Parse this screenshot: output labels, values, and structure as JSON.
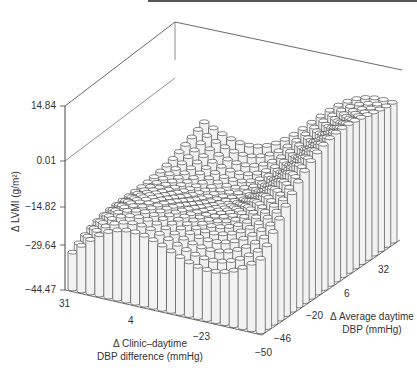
{
  "chart_data": {
    "type": "bar3d",
    "title": "",
    "zlabel": "Δ LVMI (g/m²)",
    "xlabel": "Δ Clinic–daytime DBP difference (mmHg)",
    "ylabel": "Δ Average daytime DBP (mmHg)",
    "z_ticks": [
      "14.84",
      "0.01",
      "−14.82",
      "−29.64",
      "−44.47"
    ],
    "z_range": [
      -44.47,
      14.84
    ],
    "x_ticks": [
      "31",
      "4",
      "−23",
      "−50"
    ],
    "x_range": [
      31,
      -50
    ],
    "y_ticks": [
      "−46",
      "−20",
      "6",
      "32"
    ],
    "y_range": [
      -46,
      32
    ],
    "grid": {
      "nx": 22,
      "ny": 22
    },
    "surface_description": "ΔLVMI increases toward negative clinic–daytime difference and positive average daytime change; lowest values at front-left, peaks near 14 at back corner, with an undulating valley/ridge pattern across the surface.",
    "grid_on": false,
    "legend": "none"
  },
  "labels": {
    "z_title": "Δ LVMI (g/m²)",
    "z_ticks": [
      "14.84",
      "0.01",
      "−14.82",
      "−29.64",
      "−44.47"
    ],
    "x_title_1": "Δ Clinic–daytime",
    "x_title_2": "DBP difference (mmHg)",
    "x_ticks": [
      "31",
      "4",
      "−23",
      "−50"
    ],
    "y_title_1": "Δ Average daytime",
    "y_title_2": "DBP (mmHg)",
    "y_ticks": [
      "−46",
      "−20",
      "6",
      "32"
    ]
  }
}
